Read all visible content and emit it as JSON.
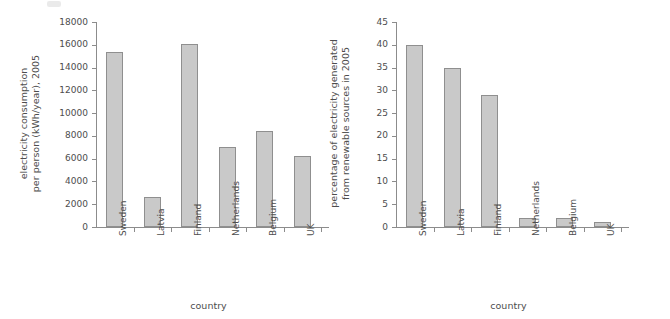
{
  "figure": {
    "background_color": "#ffffff",
    "bar_fill_color": "#c9c9c9",
    "bar_edge_color": "#8f8f8f",
    "axis_color": "#8c8c8c",
    "text_color": "#4d4d4d"
  },
  "chart_data": [
    {
      "type": "bar",
      "id": "electricity-consumption",
      "title": "",
      "xlabel": "country",
      "ylabel": "electricity consumption\nper person (kWh/year), 2005",
      "categories": [
        "Sweden",
        "Latvia",
        "Finland",
        "Netherlands",
        "Belgium",
        "UK"
      ],
      "values": [
        15400,
        2650,
        16100,
        7000,
        8450,
        6200
      ],
      "ylim": [
        0,
        18000
      ],
      "yticks": [
        0,
        2000,
        4000,
        6000,
        8000,
        10000,
        12000,
        14000,
        16000,
        18000
      ],
      "ytick_labels": [
        "0",
        "2000",
        "4000",
        "6000",
        "8000",
        "10000",
        "12000",
        "14000",
        "16000",
        "18000"
      ],
      "grid": false,
      "legend": "none"
    },
    {
      "type": "bar",
      "id": "renewable-percentage",
      "title": "",
      "xlabel": "country",
      "ylabel": "percentage of electricity generated\nfrom renewable sources in 2005",
      "categories": [
        "Sweden",
        "Latvia",
        "Finland",
        "Netherlands",
        "Belgium",
        "UK"
      ],
      "values": [
        40,
        35,
        29,
        2,
        2,
        1
      ],
      "ylim": [
        0,
        45
      ],
      "yticks": [
        0,
        5,
        10,
        15,
        20,
        25,
        30,
        35,
        40,
        45
      ],
      "ytick_labels": [
        "0",
        "5",
        "10",
        "15",
        "20",
        "25",
        "30",
        "35",
        "40",
        "45"
      ],
      "grid": false,
      "legend": "none"
    }
  ]
}
